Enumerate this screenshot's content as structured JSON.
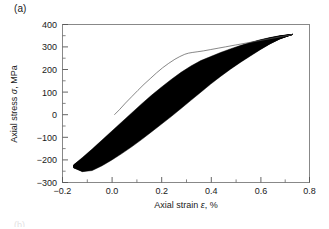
{
  "figure": {
    "panel_label": "(a)",
    "next_panel_label_partial": "(b)"
  },
  "chart_data": {
    "type": "line",
    "title": "",
    "subtitle": "",
    "xlabel_text": "Axial strain",
    "xlabel_symbol": "ε",
    "xlabel_units": ", %",
    "xlabel": "Axial strain ε, %",
    "ylabel_text": "Axial stress",
    "ylabel_symbol": "σ",
    "ylabel_units": ", MPa",
    "ylabel": "Axial stress σ, MPa",
    "xlim": [
      -0.2,
      0.8
    ],
    "ylim": [
      -300,
      400
    ],
    "xticks": [
      -0.2,
      0.0,
      0.2,
      0.4,
      0.6,
      0.8
    ],
    "xticklabels": [
      "−0.2",
      "0.0",
      "0.2",
      "0.4",
      "0.6",
      "0.8"
    ],
    "yticks": [
      -300,
      -200,
      -100,
      0,
      100,
      200,
      300,
      400
    ],
    "yticklabels": [
      "−300",
      "−200",
      "−100",
      "0",
      "100",
      "200",
      "300",
      "400"
    ],
    "x_minor_ticks_between": 1,
    "y_minor_ticks_between": 1,
    "grid": false,
    "legend": false,
    "legend_position": "none",
    "frame_color": "#808080",
    "series": [
      {
        "name": "monotonic-tensile-curve",
        "type": "line",
        "color": "#555555",
        "line_width": 0.7,
        "x": [
          0.01,
          0.03,
          0.055,
          0.08,
          0.105,
          0.13,
          0.155,
          0.18,
          0.205,
          0.23,
          0.255,
          0.275,
          0.295,
          0.31,
          0.325,
          0.345,
          0.37,
          0.4,
          0.43,
          0.46,
          0.5,
          0.545,
          0.59,
          0.64,
          0.69,
          0.73
        ],
        "y": [
          0,
          22,
          52,
          80,
          108,
          135,
          160,
          185,
          208,
          228,
          246,
          258,
          268,
          273,
          276,
          279,
          283,
          289,
          295,
          301,
          309,
          318,
          327,
          337,
          347,
          355
        ]
      },
      {
        "name": "cyclic-hysteresis-loop-band-upper-envelope",
        "type": "line",
        "color": "#000000",
        "line_width": 0.8,
        "x": [
          -0.155,
          -0.12,
          -0.08,
          -0.04,
          0.0,
          0.04,
          0.08,
          0.12,
          0.16,
          0.2,
          0.24,
          0.28,
          0.32,
          0.36,
          0.4,
          0.44,
          0.48,
          0.52,
          0.56,
          0.6,
          0.64,
          0.68,
          0.73
        ],
        "y": [
          -222,
          -190,
          -152,
          -112,
          -72,
          -32,
          8,
          48,
          86,
          122,
          156,
          188,
          216,
          240,
          258,
          276,
          292,
          307,
          320,
          332,
          342,
          350,
          356
        ]
      },
      {
        "name": "cyclic-hysteresis-loop-band-lower-envelope",
        "type": "line",
        "color": "#000000",
        "line_width": 0.8,
        "x": [
          -0.155,
          -0.12,
          -0.08,
          -0.04,
          0.0,
          0.04,
          0.08,
          0.12,
          0.16,
          0.2,
          0.24,
          0.28,
          0.32,
          0.36,
          0.4,
          0.44,
          0.48,
          0.52,
          0.56,
          0.6,
          0.64,
          0.68,
          0.73
        ],
        "y": [
          -235,
          -252,
          -247,
          -226,
          -200,
          -172,
          -142,
          -110,
          -76,
          -42,
          -8,
          28,
          64,
          100,
          136,
          170,
          202,
          232,
          260,
          288,
          314,
          336,
          356
        ]
      }
    ],
    "annotations": []
  }
}
